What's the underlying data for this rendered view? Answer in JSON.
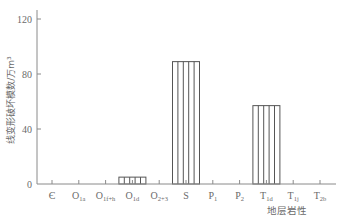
{
  "chart_data": {
    "type": "bar",
    "title": "",
    "xlabel": "地层岩性",
    "ylabel": "线变形破坏模数/万m³",
    "ylim": [
      0,
      120
    ],
    "yticks": [
      0,
      40,
      80,
      120
    ],
    "grid": false,
    "legend": "none",
    "bar_style": "vertical-hatch",
    "categories": [
      {
        "base": "Є",
        "sub": ""
      },
      {
        "base": "O",
        "sub": "1a"
      },
      {
        "base": "O",
        "sub": "1f+h"
      },
      {
        "base": "O",
        "sub": "1d"
      },
      {
        "base": "O",
        "sub": "2+3"
      },
      {
        "base": "S",
        "sub": ""
      },
      {
        "base": "P",
        "sub": "1"
      },
      {
        "base": "P",
        "sub": "2"
      },
      {
        "base": "T",
        "sub": "1d"
      },
      {
        "base": "T",
        "sub": "1j"
      },
      {
        "base": "T",
        "sub": "2b"
      }
    ],
    "values": [
      0,
      0,
      0,
      5,
      0,
      89,
      0,
      0,
      57,
      0,
      0
    ]
  }
}
